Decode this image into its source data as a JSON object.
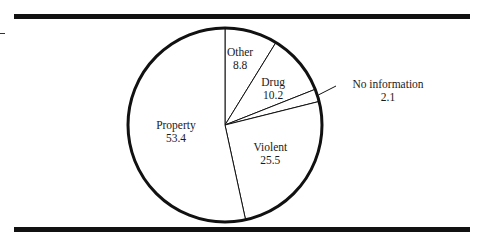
{
  "chart_data": {
    "type": "pie",
    "title": "",
    "unit": "percent",
    "start": "12 o'clock",
    "direction": "clockwise",
    "slices": [
      {
        "label": "Other",
        "value": 8.8,
        "display": "8.8"
      },
      {
        "label": "Drug",
        "value": 10.2,
        "display": "10.2"
      },
      {
        "label": "No information",
        "value": 2.1,
        "display": "2.1"
      },
      {
        "label": "Violent",
        "value": 25.5,
        "display": "25.5"
      },
      {
        "label": "Property",
        "value": 53.4,
        "display": "53.4"
      }
    ],
    "legend": "none",
    "colors": {
      "fill": "#ffffff",
      "stroke": "#111111"
    }
  }
}
